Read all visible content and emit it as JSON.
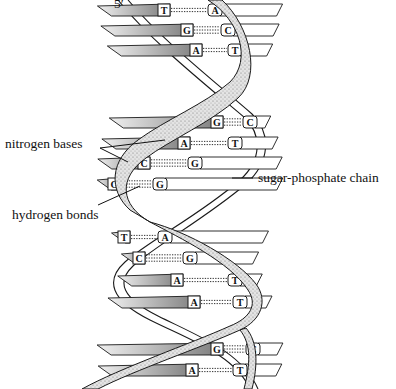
{
  "diagram": {
    "end_label": "5′",
    "labels": {
      "nitrogen_bases": "nitrogen bases",
      "hydrogen_bonds": "hydrogen bonds",
      "sugar_phosphate_chain": "sugar-phosphate chain"
    },
    "base_pairs": [
      {
        "left": "T",
        "right": "A",
        "y": 10,
        "lx": 170,
        "rx": 208
      },
      {
        "left": "G",
        "right": "C",
        "y": 30,
        "lx": 193,
        "rx": 221
      },
      {
        "left": "A",
        "right": "T",
        "y": 50,
        "lx": 202,
        "rx": 228
      },
      {
        "left": "G",
        "right": "C",
        "y": 122,
        "lx": 223,
        "rx": 243
      },
      {
        "left": "A",
        "right": "T",
        "y": 143,
        "lx": 190,
        "rx": 228
      },
      {
        "left": "C",
        "right": "G",
        "y": 163,
        "lx": 150,
        "rx": 188
      },
      {
        "left": "C",
        "right": "G",
        "y": 184,
        "lx": 120,
        "rx": 153
      },
      {
        "left": "T",
        "right": "A",
        "y": 237,
        "lx": 130,
        "rx": 158
      },
      {
        "left": "C",
        "right": "G",
        "y": 258,
        "lx": 145,
        "rx": 183
      },
      {
        "left": "A",
        "right": "T",
        "y": 280,
        "lx": 183,
        "rx": 228
      },
      {
        "left": "A",
        "right": "T",
        "y": 302,
        "lx": 200,
        "rx": 233
      },
      {
        "left": "G",
        "right": "C",
        "y": 349,
        "lx": 223,
        "rx": 246
      },
      {
        "left": "A",
        "right": "T",
        "y": 370,
        "lx": 198,
        "rx": 233
      }
    ],
    "colors": {
      "ink": "#1a1a1a",
      "stipple": "#bdbdbd",
      "shade": "#8a8a8a",
      "background": "#ffffff"
    }
  }
}
